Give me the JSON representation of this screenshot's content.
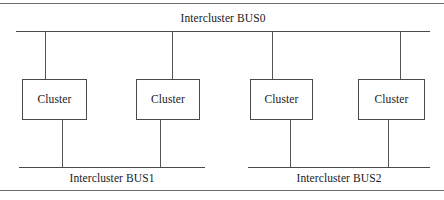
{
  "figure": {
    "type": "block-diagram",
    "colors": {
      "line": "#4a4a4a",
      "rule": "#6b6b6b",
      "text": "#1a1a1a",
      "background": "#ffffff"
    }
  },
  "buses": [
    {
      "id": "bus0",
      "label": "Intercluster BUS0"
    },
    {
      "id": "bus1",
      "label": "Intercluster BUS1"
    },
    {
      "id": "bus2",
      "label": "Intercluster BUS2"
    }
  ],
  "clusters": [
    {
      "id": "cluster-1",
      "label": "Cluster"
    },
    {
      "id": "cluster-2",
      "label": "Cluster"
    },
    {
      "id": "cluster-3",
      "label": "Cluster"
    },
    {
      "id": "cluster-4",
      "label": "Cluster"
    }
  ]
}
